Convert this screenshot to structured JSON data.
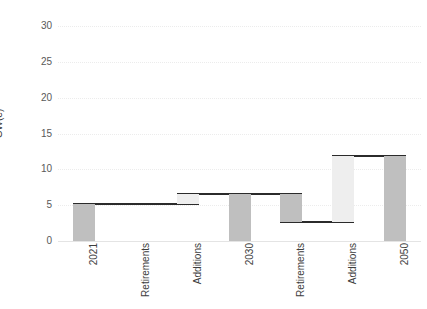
{
  "chart": {
    "title": "",
    "ylabel": "GW(e)",
    "xlabel": ""
  },
  "chart_data": {
    "type": "bar",
    "subtype": "waterfall",
    "title": "",
    "xlabel": "",
    "ylabel": "GW(e)",
    "ylim": [
      0,
      30
    ],
    "yticks": [
      0,
      5,
      10,
      15,
      20,
      25,
      30
    ],
    "ytick_labels": [
      "0",
      "5",
      "10",
      "15",
      "20",
      "25",
      "30"
    ],
    "grid": true,
    "legend": "none",
    "categories": [
      "2021",
      "Retirements",
      "Additions",
      "2030",
      "Retirements",
      "Additions",
      "2050"
    ],
    "kinds": [
      "total",
      "down",
      "up",
      "total",
      "down",
      "up",
      "total"
    ],
    "bars": [
      {
        "label": "2021",
        "kind": "total",
        "base": 0.0,
        "top": 5.1,
        "delta": 5.1,
        "color": "#bfbfbf"
      },
      {
        "label": "Retirements",
        "kind": "down",
        "base": 5.1,
        "top": 5.1,
        "delta": 0.0,
        "color": "#bfbfbf"
      },
      {
        "label": "Additions",
        "kind": "up",
        "base": 5.1,
        "top": 6.5,
        "delta": 1.4,
        "color": "#eeeeee"
      },
      {
        "label": "2030",
        "kind": "total",
        "base": 0.0,
        "top": 6.5,
        "delta": 6.5,
        "color": "#bfbfbf"
      },
      {
        "label": "Retirements",
        "kind": "down",
        "base": 2.7,
        "top": 6.5,
        "delta": -3.8,
        "color": "#bfbfbf"
      },
      {
        "label": "Additions",
        "kind": "up",
        "base": 2.7,
        "top": 11.8,
        "delta": 9.1,
        "color": "#eeeeee"
      },
      {
        "label": "2050",
        "kind": "total",
        "base": 0.0,
        "top": 11.8,
        "delta": 11.8,
        "color": "#bfbfbf"
      }
    ],
    "values": [
      5.1,
      0.0,
      1.4,
      6.5,
      -3.8,
      9.1,
      11.8
    ],
    "cumulative": [
      5.1,
      5.1,
      6.5,
      6.5,
      2.7,
      11.8,
      11.8
    ],
    "connectors": [
      {
        "from_bar": 0,
        "to_bar": 1,
        "level": 5.1
      },
      {
        "from_bar": 1,
        "to_bar": 2,
        "level": 5.1
      },
      {
        "from_bar": 2,
        "to_bar": 3,
        "level": 6.5
      },
      {
        "from_bar": 3,
        "to_bar": 4,
        "level": 6.5
      },
      {
        "from_bar": 4,
        "to_bar": 5,
        "level": 2.7
      },
      {
        "from_bar": 5,
        "to_bar": 6,
        "level": 11.8
      }
    ],
    "colors": {
      "total_bar": "#bfbfbf",
      "decrease_bar": "#bfbfbf",
      "increase_bar": "#eeeeee",
      "connector": "#2b2b2b",
      "gridline": "#ececec",
      "axis_text": "#3d3d3d"
    }
  }
}
